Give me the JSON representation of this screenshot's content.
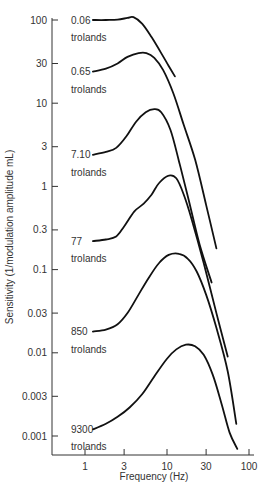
{
  "chart_data": {
    "type": "line",
    "title": "",
    "xlabel": "Frequency (Hz)",
    "ylabel": "Sensitivity (1/modulation amplitude mL)",
    "xscale": "log",
    "yscale": "log",
    "xlim": [
      0.5,
      100
    ],
    "ylim": [
      0.0007,
      100
    ],
    "grid": false,
    "legend": "none (curves labeled inline)",
    "x_ticks": [
      1,
      3,
      10,
      30,
      100
    ],
    "x_tick_labels": [
      "1",
      "3",
      "10",
      "30",
      "100"
    ],
    "y_ticks": [
      100,
      30,
      10,
      3,
      1,
      0.3,
      0.1,
      0.03,
      0.01,
      0.003,
      0.001
    ],
    "y_tick_labels": [
      "100",
      "30",
      "10",
      "3",
      "1",
      "0.3",
      "0.1",
      "0.03",
      "0.01",
      "0.003",
      "0.001"
    ],
    "series": [
      {
        "name": "0.06 trolands",
        "label_value": "0.06",
        "label_unit": "trolands",
        "x": [
          1.25,
          1.8,
          2.5,
          3.3,
          3.9,
          5.0,
          6.5,
          8.5,
          10.5,
          12.5
        ],
        "y": [
          100,
          100,
          101,
          106,
          108,
          90,
          62,
          40,
          28,
          21
        ]
      },
      {
        "name": "0.65 trolands",
        "label_value": "0.65",
        "label_unit": "trolands",
        "x": [
          1.25,
          1.8,
          2.5,
          3.3,
          4.5,
          5.6,
          7.0,
          9.0,
          12,
          16,
          22,
          30,
          40
        ],
        "y": [
          24,
          26,
          30,
          36,
          40,
          40,
          35,
          25,
          13,
          5.5,
          2.1,
          0.6,
          0.18
        ]
      },
      {
        "name": "7.10 trolands",
        "label_value": "7.10",
        "label_unit": "trolands",
        "x": [
          1.25,
          1.8,
          2.4,
          3.2,
          4.2,
          5.5,
          7.0,
          8.5,
          11,
          14,
          18,
          25,
          35
        ],
        "y": [
          2.4,
          2.6,
          2.9,
          4.0,
          6.0,
          7.8,
          8.5,
          7.8,
          4.8,
          2.0,
          0.75,
          0.2,
          0.07
        ]
      },
      {
        "name": "77 trolands",
        "label_value": "77",
        "label_unit": "trolands",
        "x": [
          1.25,
          1.8,
          2.4,
          3.0,
          4.0,
          5.2,
          6.5,
          8.0,
          10.5,
          13,
          16,
          20,
          28,
          40,
          55
        ],
        "y": [
          0.22,
          0.23,
          0.25,
          0.33,
          0.5,
          0.62,
          0.8,
          1.1,
          1.35,
          1.25,
          0.8,
          0.4,
          0.12,
          0.03,
          0.009
        ]
      },
      {
        "name": "850 trolands",
        "label_value": "850",
        "label_unit": "trolands",
        "x": [
          1.25,
          1.8,
          2.5,
          3.3,
          4.5,
          6.0,
          8.0,
          10.5,
          14,
          18,
          23,
          30,
          40,
          55,
          70
        ],
        "y": [
          0.018,
          0.019,
          0.022,
          0.03,
          0.05,
          0.08,
          0.12,
          0.15,
          0.155,
          0.135,
          0.095,
          0.05,
          0.02,
          0.006,
          0.0014
        ]
      },
      {
        "name": "9300 trolands",
        "label_value": "9300",
        "label_unit": "trolands",
        "x": [
          1.25,
          1.8,
          2.5,
          3.5,
          5.0,
          7.0,
          10,
          13,
          17,
          22,
          28,
          36,
          46,
          58,
          72
        ],
        "y": [
          0.0012,
          0.0014,
          0.0017,
          0.0022,
          0.0032,
          0.0052,
          0.0085,
          0.011,
          0.0125,
          0.012,
          0.0095,
          0.0055,
          0.0025,
          0.0011,
          0.0007
        ]
      }
    ]
  }
}
